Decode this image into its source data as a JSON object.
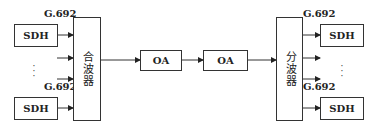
{
  "diagram": {
    "type": "WDM system block diagram",
    "left": {
      "sdh_top": "SDH",
      "sdh_bottom": "SDH",
      "label_top": "G.692",
      "label_bottom": "G.692",
      "ellipsis": "⋮",
      "combiner": "合波器"
    },
    "middle": {
      "amplifier_1": "OA",
      "amplifier_2": "OA"
    },
    "right": {
      "divider": "分波器",
      "label_top": "G.692",
      "label_bottom": "G.692",
      "sdh_top": "SDH",
      "sdh_bottom": "SDH",
      "ellipsis": "⋮"
    },
    "colors": {
      "stroke": "#333333",
      "background": "#ffffff",
      "text": "#222222"
    }
  }
}
